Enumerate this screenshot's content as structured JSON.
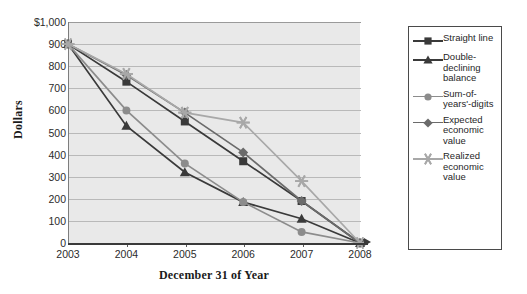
{
  "chart_data": {
    "type": "line",
    "title": "",
    "xlabel": "December 31 of Year",
    "ylabel": "Dollars",
    "categories": [
      "2003",
      "2004",
      "2005",
      "2006",
      "2007",
      "2008"
    ],
    "x_tick_labels": [
      "2003",
      "2004",
      "2005",
      "2006",
      "2007",
      "2008"
    ],
    "y_tick_labels": [
      "$1,000",
      "900",
      "800",
      "700",
      "600",
      "500",
      "400",
      "300",
      "200",
      "100",
      "0"
    ],
    "ylim": [
      0,
      1000
    ],
    "y_tick_values": [
      1000,
      900,
      800,
      700,
      600,
      500,
      400,
      300,
      200,
      100,
      0
    ],
    "grid": true,
    "legend_position": "right",
    "series": [
      {
        "name": "Straight line",
        "marker": "square",
        "color": "#3a3a3a",
        "values": [
          900,
          730,
          550,
          370,
          190,
          0
        ]
      },
      {
        "name": "Double-declining balance",
        "marker": "triangle",
        "color": "#3a3a3a",
        "values": [
          900,
          530,
          320,
          185,
          110,
          0
        ]
      },
      {
        "name": "Sum-of-years'-digits",
        "marker": "circle",
        "color": "#8c8c8c",
        "values": [
          900,
          600,
          360,
          185,
          50,
          0
        ]
      },
      {
        "name": "Expected economic value",
        "marker": "diamond",
        "color": "#6b6b6b",
        "values": [
          900,
          760,
          590,
          410,
          190,
          0
        ]
      },
      {
        "name": "Realized economic value",
        "marker": "asterisk",
        "color": "#a8a8a8",
        "values": [
          900,
          765,
          590,
          545,
          280,
          0
        ]
      }
    ]
  },
  "legend": {
    "items": [
      {
        "label": "Straight line"
      },
      {
        "label": "Double-declining balance"
      },
      {
        "label": "Sum-of-years'-digits"
      },
      {
        "label": "Expected economic value"
      },
      {
        "label": "Realized economic value"
      }
    ]
  },
  "colors": {
    "plot_background": "#e9e9e9",
    "gridline": "#b9b9b9",
    "axis": "#3a3a3a",
    "legend_border": "#4a4a4a",
    "page_background": "#ffffff"
  }
}
